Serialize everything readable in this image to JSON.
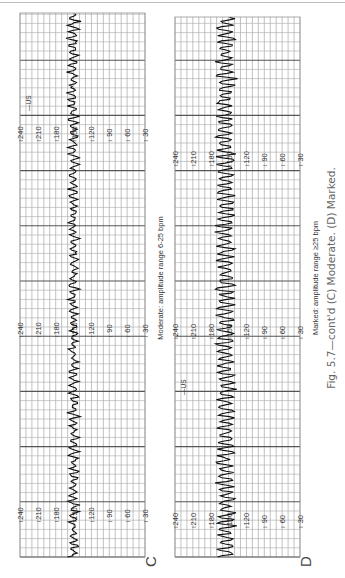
{
  "caption": "Fig. 5.7—cont'd (C) Moderate. (D) Marked.",
  "chart_data": [
    {
      "type": "line",
      "panel": "C",
      "title": "Moderate: amplitude range 6-25 bpm",
      "ylabel": "FHR (bpm)",
      "ylim": [
        30,
        240
      ],
      "yticks": [
        240,
        210,
        180,
        150,
        120,
        90,
        60,
        30
      ],
      "scale_label_positions_fraction": [
        0.08,
        0.42,
        0.78
      ],
      "marker": {
        "label": "US",
        "position_fraction": 0.82
      },
      "baseline_bpm": 150,
      "amplitude_range_bpm": [
        6,
        25
      ],
      "grid": true
    },
    {
      "type": "line",
      "panel": "D",
      "title": "Marked: amplitude range ≥25 bpm",
      "ylabel": "FHR (bpm)",
      "ylim": [
        30,
        240
      ],
      "yticks": [
        240,
        210,
        180,
        150,
        120,
        90,
        60,
        30
      ],
      "scale_label_positions_fraction": [
        0.07,
        0.42,
        0.74
      ],
      "marker": {
        "label": "US",
        "position_fraction": 0.3
      },
      "baseline_bpm": 155,
      "amplitude_range_bpm": [
        25,
        40
      ],
      "grid": true
    }
  ]
}
